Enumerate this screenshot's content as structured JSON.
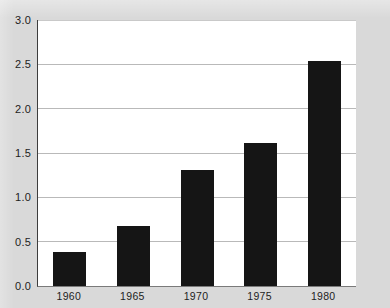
{
  "chart_data": {
    "type": "bar",
    "title": "",
    "subtitle": "",
    "xlabel": "",
    "ylabel": "",
    "categories": [
      "1960",
      "1965",
      "1970",
      "1975",
      "1980"
    ],
    "values": [
      0.38,
      0.68,
      1.31,
      1.61,
      2.54
    ],
    "series": [
      {
        "name": "",
        "values": [
          0.38,
          0.68,
          1.31,
          1.61,
          2.54
        ]
      }
    ],
    "ylim": [
      0.0,
      3.0
    ],
    "ytick_labels": [
      "0.0",
      "0.5",
      "1.0",
      "1.5",
      "2.0",
      "2.5",
      "3.0"
    ],
    "ytick_values": [
      0.0,
      0.5,
      1.0,
      1.5,
      2.0,
      2.5,
      3.0
    ],
    "xtick_labels": [
      "1960",
      "1965",
      "1970",
      "1975",
      "1980"
    ],
    "grid": true,
    "grid_axis": "y",
    "legend": false,
    "legend_position": "none",
    "annotations": [],
    "colors": {
      "bar": "#151515",
      "gridline": "#b9b9b9",
      "axis": "#3d3d3d",
      "plot_background": "#ffffff",
      "figure_background": "#d9d9d9",
      "tick_label": "#1d1d1d"
    }
  }
}
